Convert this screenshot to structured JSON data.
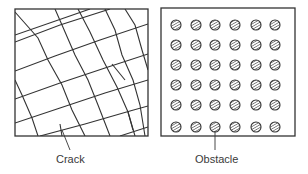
{
  "panels": [
    {
      "id": "crack-panel",
      "label": "Crack",
      "description": "Irregular grid of crack lines forming rotated quadrilateral cells"
    },
    {
      "id": "obstacle-panel",
      "label": "Obstacle",
      "description": "6x6 regular array of hatched circular obstacles",
      "rows": 6,
      "cols": 6
    }
  ],
  "colors": {
    "line": "#333333",
    "background": "#ffffff"
  }
}
